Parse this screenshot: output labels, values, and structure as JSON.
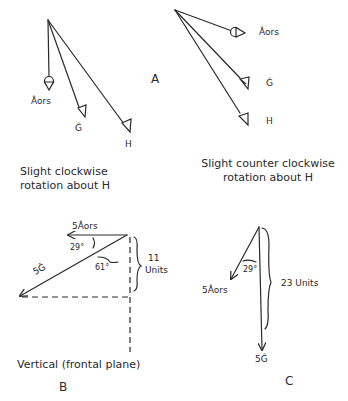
{
  "panel_a": {
    "letter": "A",
    "left": {
      "labels": {
        "aors": "Âors",
        "g": "Ĝ",
        "h": "H"
      },
      "caption_line1": "Slight clockwise",
      "caption_line2": "rotation about H"
    },
    "right": {
      "labels": {
        "aors": "Âors",
        "g": "Ĝ",
        "h": "H"
      },
      "caption_line1": "Slight counter clockwise",
      "caption_line2": "rotation about H"
    }
  },
  "panel_b": {
    "letter": "B",
    "vector_aors": "5Âors",
    "vector_g": "5Ĝ",
    "angle_small": "29°",
    "angle_large": "61°",
    "height_value": "11",
    "height_unit": "Units",
    "caption": "Vertical (frontal plane)"
  },
  "panel_c": {
    "letter": "C",
    "vector_aors": "5Âors",
    "vector_g": "5Ĝ",
    "angle": "29°",
    "length_label": "23 Units"
  }
}
